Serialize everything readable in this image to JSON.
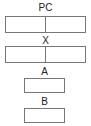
{
  "diagram": {
    "nodes": [
      {
        "id": "pc",
        "label": "PC",
        "cells": 2
      },
      {
        "id": "x",
        "label": "X",
        "cells": 2
      },
      {
        "id": "a",
        "label": "A",
        "cells": 1
      },
      {
        "id": "b",
        "label": "B",
        "cells": 1
      }
    ],
    "colors": {
      "border": "#777777",
      "text": "#222222",
      "background": "#ffffff"
    }
  }
}
